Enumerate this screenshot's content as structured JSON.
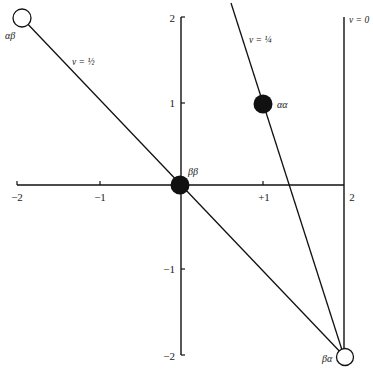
{
  "figure": {
    "type": "state-space diagram",
    "x_axis": {
      "ticks": [
        {
          "value": -2,
          "label": "−2"
        },
        {
          "value": -1,
          "label": "−1"
        },
        {
          "value": 1,
          "label": "+1"
        },
        {
          "value": 2,
          "label": "2"
        }
      ]
    },
    "y_axis": {
      "ticks": [
        {
          "value": 2,
          "label": "2"
        },
        {
          "value": 1,
          "label": "1"
        },
        {
          "value": -1,
          "label": "−1"
        },
        {
          "value": -2,
          "label": "−2"
        }
      ]
    },
    "points": [
      {
        "id": "alpha-beta",
        "label": "αβ",
        "x": -2,
        "y": 2,
        "filled": false
      },
      {
        "id": "beta-beta",
        "label": "ββ",
        "x": 0,
        "y": 0,
        "filled": true
      },
      {
        "id": "alpha-alpha",
        "label": "αα",
        "x": 1,
        "y": 1,
        "filled": true
      },
      {
        "id": "beta-alpha",
        "label": "βα",
        "x": 2,
        "y": -2,
        "filled": false
      }
    ],
    "lines": [
      {
        "id": "v-half",
        "label": "v = ½",
        "from": "alpha-beta",
        "to": "beta-alpha"
      },
      {
        "id": "v-quarter",
        "label": "v = ¼",
        "through": [
          "alpha-alpha",
          "beta-alpha"
        ]
      },
      {
        "id": "v-zero",
        "label": "v = 0",
        "x": 2
      }
    ],
    "caption": ""
  },
  "colors": {
    "ink": "#111111",
    "background": "#ffffff"
  }
}
